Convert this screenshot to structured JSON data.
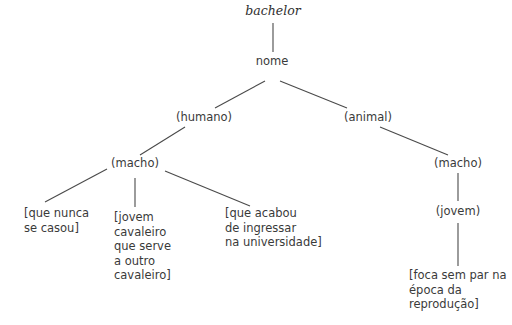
{
  "diagram": {
    "type": "semantic-tree",
    "root": {
      "id": "bachelor",
      "label": "bachelor"
    },
    "nodes": {
      "bachelor": "bachelor",
      "nome": "nome",
      "humano": "(humano)",
      "animal": "(animal)",
      "macho_humano": "(macho)",
      "macho_animal": "(macho)",
      "jovem": "(jovem)",
      "leaf1": "[que nunca\nse casou]",
      "leaf2": "[jovem\ncavaleiro\nque serve\na outro\ncavaleiro]",
      "leaf3": "[que acabou\nde ingressar\nna universidade]",
      "leaf4": "[foca sem par na\népoca da\nreprodução]"
    },
    "edges": [
      [
        "bachelor",
        "nome"
      ],
      [
        "nome",
        "humano"
      ],
      [
        "nome",
        "animal"
      ],
      [
        "humano",
        "macho_humano"
      ],
      [
        "macho_humano",
        "leaf1"
      ],
      [
        "macho_humano",
        "leaf2"
      ],
      [
        "macho_humano",
        "leaf3"
      ],
      [
        "animal",
        "macho_animal"
      ],
      [
        "macho_animal",
        "jovem"
      ],
      [
        "jovem",
        "leaf4"
      ]
    ]
  }
}
